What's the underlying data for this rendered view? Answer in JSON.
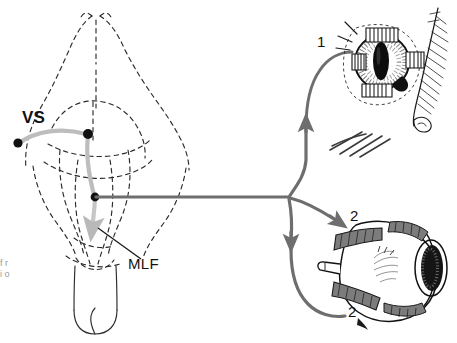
{
  "figure": {
    "domain": "diagram",
    "background_color": "#ffffff",
    "ink_color": "#1a1a1a",
    "tract_color": "#6e6e6e",
    "pale_tract_color": "#b9b9b9",
    "width": 457,
    "height": 343
  },
  "labels": {
    "vs": "VS",
    "mlf": "MLF",
    "eye_upper_muscle": "1",
    "eye_lower_muscle_top": "2",
    "eye_lower_muscle_bottom": "2",
    "edge_fragment": "f r i o"
  },
  "panels": {
    "brain": {
      "name": "rodent brain dorsal view",
      "style": "dashed outline",
      "structures": [
        "olfactory bulbs",
        "cerebral hemispheres",
        "superior colliculus",
        "cerebellum",
        "brainstem",
        "spinal cord"
      ]
    },
    "eye_frontal": {
      "name": "frontal view of eye with eyelid and extraocular muscles",
      "pupil_shape": "vertical ellipse",
      "muscle_count": 4
    },
    "eye_lateral": {
      "name": "lateral view of eyeball with optic nerve and rectus muscles",
      "muscle_count": 4
    }
  },
  "pathway": {
    "nodes": [
      {
        "id": "vs-left",
        "x": 18,
        "y": 143
      },
      {
        "id": "vs-right",
        "x": 88,
        "y": 135
      },
      {
        "id": "mlf-node",
        "x": 95,
        "y": 197
      },
      {
        "id": "branch",
        "x": 290,
        "y": 197
      }
    ],
    "branches": [
      {
        "from": "branch",
        "to": "eye_frontal",
        "arrow": "up",
        "label": "1"
      },
      {
        "from": "branch",
        "to": "eye_lateral_upper",
        "arrow": "down-right",
        "label": "2"
      },
      {
        "from": "branch",
        "to": "eye_lateral_lower",
        "arrow": "down",
        "label": "2"
      }
    ]
  }
}
